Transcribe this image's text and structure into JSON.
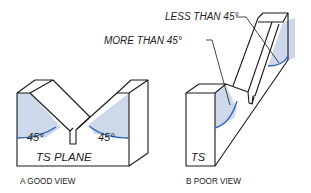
{
  "figure_a": {
    "angle_left": "45°",
    "angle_right": "45°",
    "plane_label": "TS PLANE",
    "caption": "A  GOOD VIEW"
  },
  "figure_b": {
    "callout_less": "LESS THAN 45°",
    "callout_more": "MORE THAN 45°",
    "plane_label": "TS",
    "caption": "B  POOR VIEW"
  },
  "colors": {
    "line": "#1a1a1a",
    "shade": "#cdd8ea",
    "arc": "#2a62b8"
  }
}
